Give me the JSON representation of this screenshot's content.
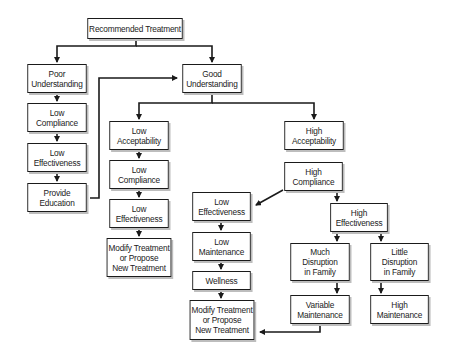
{
  "diagram": {
    "type": "flowchart",
    "title": "Recommended Treatment",
    "colors": {
      "line": "#1a1a1a",
      "box_border": "#1a1a1a",
      "shadow": "#bdbdbd",
      "text": "#222222",
      "background": "#ffffff"
    },
    "nodes": {
      "root": {
        "label": "Recommended Treatment",
        "x": 82,
        "y": 18,
        "w": 106,
        "h": 21
      },
      "poor_understanding": {
        "label": "Poor\nUnderstanding",
        "x": 24,
        "y": 64,
        "w": 66,
        "h": 29
      },
      "left_low_compliance": {
        "label": "Low\nCompliance",
        "x": 24,
        "y": 103,
        "w": 66,
        "h": 29
      },
      "left_low_effect": {
        "label": "Low\nEffectiveness",
        "x": 24,
        "y": 143,
        "w": 66,
        "h": 29
      },
      "provide_education": {
        "label": "Provide\nEducation",
        "x": 24,
        "y": 183,
        "w": 66,
        "h": 29
      },
      "good_understanding": {
        "label": "Good\nUnderstanding",
        "x": 179,
        "y": 64,
        "w": 66,
        "h": 29
      },
      "low_acceptability": {
        "label": "Low\nAcceptability",
        "x": 106,
        "y": 121,
        "w": 66,
        "h": 29
      },
      "mid_low_compliance": {
        "label": "Low\nCompliance",
        "x": 106,
        "y": 160,
        "w": 66,
        "h": 29
      },
      "mid_low_effect": {
        "label": "Low\nEffectiveness",
        "x": 106,
        "y": 199,
        "w": 66,
        "h": 29
      },
      "modify_1": {
        "label": "Modify Treatment\nor Propose\nNew Treatment",
        "x": 103,
        "y": 238,
        "w": 72,
        "h": 39
      },
      "high_acceptability": {
        "label": "High\nAcceptability",
        "x": 281,
        "y": 121,
        "w": 66,
        "h": 29
      },
      "high_compliance": {
        "label": "High\nCompliance",
        "x": 281,
        "y": 162,
        "w": 65,
        "h": 29
      },
      "right_low_effect": {
        "label": "Low\nEffectiveness",
        "x": 189,
        "y": 192,
        "w": 65,
        "h": 29
      },
      "low_maintenance": {
        "label": "Low\nMaintenance",
        "x": 189,
        "y": 232,
        "w": 65,
        "h": 29
      },
      "wellness": {
        "label": "Wellness",
        "x": 189,
        "y": 271,
        "w": 65,
        "h": 19
      },
      "modify_2": {
        "label": "Modify Treatment\nor Propose\nNew Treatment",
        "x": 186,
        "y": 300,
        "w": 72,
        "h": 40
      },
      "high_effectiveness": {
        "label": "High\nEffectiveness",
        "x": 327,
        "y": 203,
        "w": 64,
        "h": 29
      },
      "much_disruption": {
        "label": "Much\nDisruption\nin Family",
        "x": 287,
        "y": 243,
        "w": 66,
        "h": 38
      },
      "little_disruption": {
        "label": "Little\nDisruption\nin Family",
        "x": 367,
        "y": 243,
        "w": 65,
        "h": 38
      },
      "variable_maintenance": {
        "label": "Variable\nMaintenance",
        "x": 287,
        "y": 295,
        "w": 66,
        "h": 29
      },
      "high_maintenance": {
        "label": "High\nMaintenance",
        "x": 367,
        "y": 295,
        "w": 65,
        "h": 29
      }
    },
    "edges": [
      {
        "from": "root",
        "to": "poor_understanding"
      },
      {
        "from": "root",
        "to": "good_understanding"
      },
      {
        "from": "poor_understanding",
        "to": "left_low_compliance"
      },
      {
        "from": "left_low_compliance",
        "to": "left_low_effect"
      },
      {
        "from": "left_low_effect",
        "to": "provide_education"
      },
      {
        "from": "provide_education",
        "to": "good_understanding"
      },
      {
        "from": "good_understanding",
        "to": "low_acceptability"
      },
      {
        "from": "good_understanding",
        "to": "high_acceptability"
      },
      {
        "from": "low_acceptability",
        "to": "mid_low_compliance"
      },
      {
        "from": "mid_low_compliance",
        "to": "mid_low_effect"
      },
      {
        "from": "mid_low_effect",
        "to": "modify_1"
      },
      {
        "from": "high_compliance",
        "to": "right_low_effect"
      },
      {
        "from": "high_compliance",
        "to": "high_effectiveness"
      },
      {
        "from": "right_low_effect",
        "to": "low_maintenance"
      },
      {
        "from": "low_maintenance",
        "to": "wellness"
      },
      {
        "from": "wellness",
        "to": "modify_2"
      },
      {
        "from": "high_effectiveness",
        "to": "much_disruption"
      },
      {
        "from": "high_effectiveness",
        "to": "little_disruption"
      },
      {
        "from": "much_disruption",
        "to": "variable_maintenance"
      },
      {
        "from": "little_disruption",
        "to": "high_maintenance"
      },
      {
        "from": "variable_maintenance",
        "to": "modify_2"
      }
    ]
  }
}
